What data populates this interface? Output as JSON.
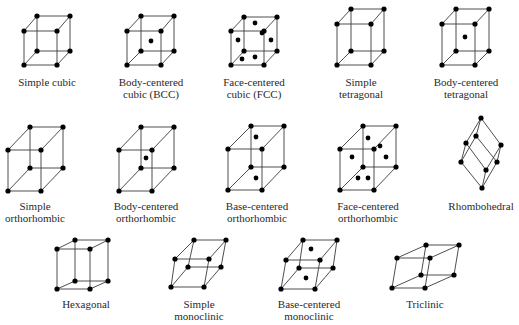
{
  "colors": {
    "line": "#3a3a3a",
    "atom": "#000000",
    "text": "#2a2a2a",
    "background": "#ffffff"
  },
  "lattices": [
    {
      "id": "simple-cubic",
      "label": [
        "Simple cubic"
      ],
      "label_pos": [
        47,
        76
      ],
      "front": [
        [
          24,
          31
        ],
        [
          57,
          31
        ],
        [
          57,
          65
        ],
        [
          24,
          65
        ]
      ],
      "back": [
        [
          37,
          16
        ],
        [
          70,
          16
        ],
        [
          70,
          51
        ],
        [
          37,
          51
        ]
      ],
      "extra": []
    },
    {
      "id": "bcc",
      "label": [
        "Body-centered",
        "cubic (BCC)"
      ],
      "label_pos": [
        151,
        76
      ],
      "front": [
        [
          127,
          31
        ],
        [
          161,
          31
        ],
        [
          161,
          65
        ],
        [
          127,
          65
        ]
      ],
      "back": [
        [
          141,
          16
        ],
        [
          174,
          16
        ],
        [
          174,
          51
        ],
        [
          141,
          51
        ]
      ],
      "extra": [
        [
          151,
          41
        ]
      ]
    },
    {
      "id": "fcc",
      "label": [
        "Face-centered",
        "cubic (FCC)"
      ],
      "label_pos": [
        254,
        76
      ],
      "front": [
        [
          231,
          31
        ],
        [
          264,
          31
        ],
        [
          264,
          65
        ],
        [
          231,
          65
        ]
      ],
      "back": [
        [
          244,
          17
        ],
        [
          277,
          17
        ],
        [
          277,
          51
        ],
        [
          244,
          51
        ]
      ],
      "extra": [
        [
          255,
          23
        ],
        [
          238,
          40
        ],
        [
          271,
          40
        ],
        [
          255,
          57
        ],
        [
          262,
          33
        ],
        [
          242,
          59
        ]
      ]
    },
    {
      "id": "simple-tetragonal",
      "label": [
        "Simple",
        "tetragonal"
      ],
      "label_pos": [
        361,
        76
      ],
      "front": [
        [
          337,
          24
        ],
        [
          371,
          24
        ],
        [
          371,
          65
        ],
        [
          337,
          65
        ]
      ],
      "back": [
        [
          351,
          9
        ],
        [
          384,
          9
        ],
        [
          384,
          51
        ],
        [
          351,
          51
        ]
      ],
      "extra": []
    },
    {
      "id": "body-centered-tetragonal",
      "label": [
        "Body-centered",
        "tetragonal"
      ],
      "label_pos": [
        466,
        76
      ],
      "front": [
        [
          442,
          24
        ],
        [
          475,
          24
        ],
        [
          475,
          65
        ],
        [
          442,
          65
        ]
      ],
      "back": [
        [
          456,
          9
        ],
        [
          489,
          9
        ],
        [
          489,
          51
        ],
        [
          456,
          51
        ]
      ],
      "extra": [
        [
          465,
          37
        ]
      ]
    },
    {
      "id": "simple-orthorhombic",
      "label": [
        "Simple",
        "orthorhombic"
      ],
      "label_pos": [
        35,
        200
      ],
      "front": [
        [
          8,
          150
        ],
        [
          41,
          150
        ],
        [
          41,
          191
        ],
        [
          8,
          191
        ]
      ],
      "back": [
        [
          30,
          127
        ],
        [
          63,
          127
        ],
        [
          63,
          168
        ],
        [
          30,
          168
        ]
      ],
      "extra": []
    },
    {
      "id": "body-centered-orthorhombic",
      "label": [
        "Body-centered",
        "orthorhombic"
      ],
      "label_pos": [
        146,
        200
      ],
      "front": [
        [
          119,
          150
        ],
        [
          152,
          150
        ],
        [
          152,
          191
        ],
        [
          119,
          191
        ]
      ],
      "back": [
        [
          141,
          127
        ],
        [
          174,
          127
        ],
        [
          174,
          168
        ],
        [
          141,
          168
        ]
      ],
      "extra": [
        [
          146,
          158
        ]
      ]
    },
    {
      "id": "base-centered-orthorhombic",
      "label": [
        "Base-centered",
        "orthorhombic"
      ],
      "label_pos": [
        257,
        200
      ],
      "front": [
        [
          228,
          149
        ],
        [
          262,
          149
        ],
        [
          262,
          190
        ],
        [
          228,
          190
        ]
      ],
      "back": [
        [
          251,
          126
        ],
        [
          284,
          126
        ],
        [
          284,
          167
        ],
        [
          251,
          167
        ]
      ],
      "extra": [
        [
          256,
          137
        ],
        [
          256,
          178
        ]
      ]
    },
    {
      "id": "face-centered-orthorhombic",
      "label": [
        "Face-centered",
        "orthorhombic"
      ],
      "label_pos": [
        368,
        200
      ],
      "front": [
        [
          340,
          149
        ],
        [
          374,
          149
        ],
        [
          374,
          190
        ],
        [
          340,
          190
        ]
      ],
      "back": [
        [
          363,
          126
        ],
        [
          396,
          126
        ],
        [
          396,
          167
        ],
        [
          363,
          167
        ]
      ],
      "extra": [
        [
          368,
          138
        ],
        [
          352,
          157
        ],
        [
          386,
          157
        ],
        [
          368,
          178
        ],
        [
          380,
          146
        ],
        [
          358,
          178
        ]
      ]
    },
    {
      "id": "rhombohedral",
      "label": [
        "Rhombohedral"
      ],
      "label_pos": [
        481,
        200
      ],
      "front": [
        [
          466,
          143
        ],
        [
          486,
          170
        ],
        [
          482,
          188
        ],
        [
          461,
          162
        ]
      ],
      "back": [
        [
          481,
          118
        ],
        [
          501,
          145
        ],
        [
          497,
          162
        ],
        [
          476,
          136
        ]
      ],
      "extra": []
    },
    {
      "id": "hexagonal",
      "label": [
        "Hexagonal"
      ],
      "label_pos": [
        86,
        298
      ],
      "front": [
        [
          57,
          249
        ],
        [
          90,
          249
        ],
        [
          90,
          289
        ],
        [
          57,
          289
        ]
      ],
      "back": [
        [
          75,
          240
        ],
        [
          108,
          240
        ],
        [
          108,
          281
        ],
        [
          75,
          281
        ]
      ],
      "extra": []
    },
    {
      "id": "simple-monoclinic",
      "label": [
        "Simple",
        "monoclinic"
      ],
      "label_pos": [
        199,
        298
      ],
      "front": [
        [
          175,
          259
        ],
        [
          209,
          259
        ],
        [
          204,
          287
        ],
        [
          171,
          287
        ]
      ],
      "back": [
        [
          194,
          240
        ],
        [
          226,
          240
        ],
        [
          221,
          267
        ],
        [
          188,
          267
        ]
      ],
      "extra": []
    },
    {
      "id": "base-centered-monoclinic",
      "label": [
        "Base-centered",
        "monoclinic"
      ],
      "label_pos": [
        309,
        298
      ],
      "front": [
        [
          286,
          260
        ],
        [
          320,
          260
        ],
        [
          315,
          289
        ],
        [
          281,
          289
        ]
      ],
      "back": [
        [
          303,
          240
        ],
        [
          337,
          240
        ],
        [
          333,
          268
        ],
        [
          299,
          268
        ]
      ],
      "extra": [
        [
          311,
          249
        ],
        [
          306,
          278
        ]
      ]
    },
    {
      "id": "triclinic",
      "label": [
        "Triclinic"
      ],
      "label_pos": [
        425,
        298
      ],
      "front": [
        [
          397,
          258
        ],
        [
          430,
          258
        ],
        [
          425,
          288
        ],
        [
          392,
          288
        ]
      ],
      "back": [
        [
          426,
          245
        ],
        [
          459,
          245
        ],
        [
          454,
          275
        ],
        [
          421,
          275
        ]
      ],
      "extra": []
    }
  ]
}
